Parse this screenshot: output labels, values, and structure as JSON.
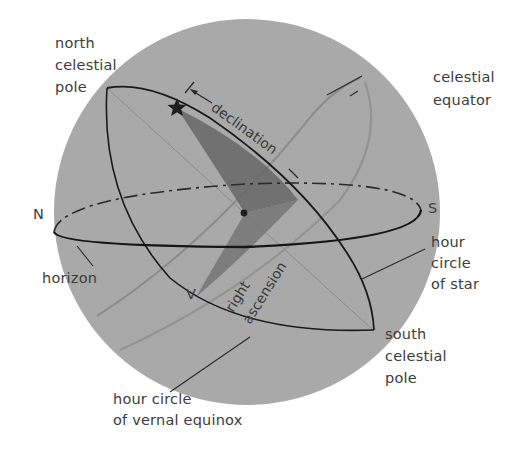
{
  "diagram": {
    "colors": {
      "sphere": "#a9a9a9",
      "shaded_angle": "#6e6e6e",
      "lines": "#1e1e1e",
      "equator_line": "#8a8a8a",
      "label_text": "#3c3c3c",
      "background": "#ffffff"
    },
    "labels": {
      "north_celestial_pole": "north\ncelestial\npole",
      "celestial_equator": "celestial\nequator",
      "north": "N",
      "south": "S",
      "horizon": "horizon",
      "hour_circle_of_star": "hour\ncircle\nof star",
      "south_celestial_pole": "south\ncelestial\npole",
      "hour_circle_of_vernal_equinox": "hour circle\nof vernal equinox",
      "vernal_equinox": "V",
      "declination": "declination",
      "right_ascension_line1": "right",
      "right_ascension_line2": "ascension"
    },
    "markers": {
      "star": "star-icon",
      "observer": "center-dot"
    }
  }
}
